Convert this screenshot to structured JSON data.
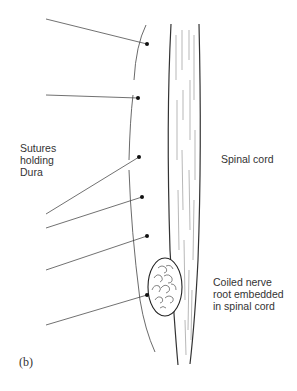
{
  "labels": {
    "sutures": [
      "Sutures",
      "holding",
      "Dura"
    ],
    "spinal_cord": "Spinal cord",
    "nerve_root": [
      "Coiled nerve",
      "root embedded",
      "in spinal cord"
    ],
    "panel": "(b)"
  },
  "colors": {
    "line": "#333333",
    "background": "#ffffff"
  }
}
